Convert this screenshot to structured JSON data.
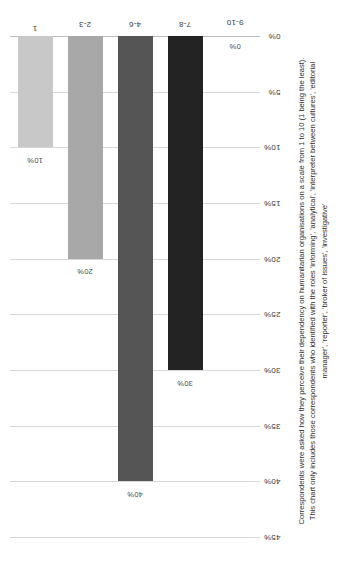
{
  "chart_data": {
    "type": "bar",
    "orientation": "vertical",
    "title": "",
    "subtitle": "",
    "xlabel": "",
    "ylabel": "",
    "categories": [
      "1",
      "2-3",
      "4-6",
      "7-8",
      "9-10"
    ],
    "values": [
      10,
      20,
      40,
      30,
      0
    ],
    "value_labels": [
      "10%",
      "20%",
      "40%",
      "30%",
      "0%"
    ],
    "bar_colors": [
      "#c8c8c8",
      "#a8a8a8",
      "#555555",
      "#232323",
      "#ffffff"
    ],
    "ylim": [
      0,
      45
    ],
    "ytick_labels": [
      "0%",
      "5%",
      "10%",
      "15%",
      "20%",
      "25%",
      "30%",
      "35%",
      "40%",
      "45%"
    ],
    "ytick_values": [
      0,
      5,
      10,
      15,
      20,
      25,
      30,
      35,
      40,
      45
    ],
    "grid": true,
    "legend": "none",
    "page_rotation": "90-ccw"
  },
  "caption": {
    "line1": "Correspondents were asked how they perceive their dependency on humanitarian organisations on a scale from 1 to 10 (1 being the least).",
    "line2": "This chart only includes those correspondents who identified with the roles 'informing', 'analytical', 'interpreter between cultures', 'editorial",
    "line3": "manager', 'reporter', 'broker of issues', 'investigative'"
  }
}
